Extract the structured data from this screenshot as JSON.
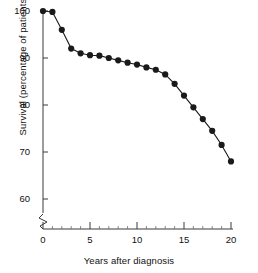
{
  "chart_data": {
    "type": "line",
    "title": "",
    "xlabel": "Years after diagnosis",
    "ylabel": "Survival (percentage of patients)",
    "xlim": [
      0,
      20.6
    ],
    "ylim": [
      58.5,
      101.5
    ],
    "xticks": [
      0,
      5,
      10,
      15,
      20
    ],
    "xtick_labels": [
      "0",
      "5",
      "10",
      "15",
      "20"
    ],
    "xminor_ticks": [
      1,
      2,
      3,
      4,
      6,
      7,
      8,
      9,
      11,
      12,
      13,
      14,
      16,
      17,
      18,
      19
    ],
    "yticks": [
      60,
      70,
      80,
      90,
      100
    ],
    "ytick_labels": [
      "60",
      "70",
      "80",
      "90",
      "100"
    ],
    "grid": false,
    "legend": null,
    "axis_break": {
      "axis": "y",
      "symbol": "zigzag",
      "at": 60
    },
    "marker": "filled-circle",
    "marker_color": "#1a1a1a",
    "line_color": "#1a1a1a",
    "x": [
      0,
      1,
      2,
      3,
      4,
      5,
      6,
      7,
      8,
      9,
      10,
      11,
      12,
      13,
      14,
      15,
      16,
      17,
      18,
      19,
      20
    ],
    "values": [
      100.0,
      99.8,
      96.0,
      92.0,
      91.0,
      90.6,
      90.5,
      90.0,
      89.5,
      89.0,
      88.6,
      88.0,
      87.5,
      86.5,
      84.5,
      82.0,
      79.5,
      77.0,
      74.5,
      71.5,
      68.0
    ],
    "series": [
      {
        "name": "Survival",
        "values": [
          100.0,
          99.8,
          96.0,
          92.0,
          91.0,
          90.6,
          90.5,
          90.0,
          89.5,
          89.0,
          88.6,
          88.0,
          87.5,
          86.5,
          84.5,
          82.0,
          79.5,
          77.0,
          74.5,
          71.5,
          68.0
        ]
      }
    ]
  }
}
